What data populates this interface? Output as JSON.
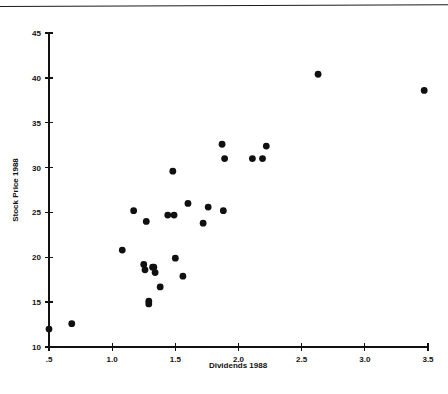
{
  "figure": {
    "background_color": "#ffffff",
    "ink_color": "#101010",
    "has_top_rule": true
  },
  "chart_data": {
    "type": "scatter",
    "title": "",
    "subtitle": "",
    "xlabel": "Dividends 1988",
    "ylabel": "Stock Price 1988",
    "xlim": [
      0.5,
      3.5
    ],
    "ylim": [
      10,
      45
    ],
    "xticks": [
      0.5,
      1.0,
      1.5,
      2.0,
      2.5,
      3.0,
      3.5
    ],
    "xtick_labels": [
      ".5",
      "1.0",
      "1.5",
      "2.0",
      "2.5",
      "3.0",
      "3.5"
    ],
    "yticks": [
      10,
      15,
      20,
      25,
      30,
      35,
      40,
      45
    ],
    "ytick_labels": [
      "10",
      "15",
      "20",
      "25",
      "30",
      "35",
      "40",
      "45"
    ],
    "grid": false,
    "legend": null,
    "legend_position": "none",
    "marker": "filled-circle",
    "marker_color": "#101010",
    "marker_size_px": 3.4,
    "series": [
      {
        "name": "stocks",
        "points": [
          [
            0.5,
            12.0
          ],
          [
            0.68,
            12.6
          ],
          [
            1.08,
            20.8
          ],
          [
            1.17,
            25.2
          ],
          [
            1.25,
            19.2
          ],
          [
            1.26,
            18.6
          ],
          [
            1.27,
            24.0
          ],
          [
            1.29,
            14.8
          ],
          [
            1.29,
            15.1
          ],
          [
            1.32,
            18.9
          ],
          [
            1.33,
            18.9
          ],
          [
            1.34,
            18.3
          ],
          [
            1.38,
            16.7
          ],
          [
            1.44,
            24.7
          ],
          [
            1.48,
            29.6
          ],
          [
            1.49,
            24.7
          ],
          [
            1.5,
            19.9
          ],
          [
            1.56,
            17.9
          ],
          [
            1.6,
            26.0
          ],
          [
            1.72,
            23.8
          ],
          [
            1.76,
            25.6
          ],
          [
            1.87,
            32.6
          ],
          [
            1.88,
            25.2
          ],
          [
            1.89,
            31.0
          ],
          [
            2.11,
            31.0
          ],
          [
            2.19,
            31.0
          ],
          [
            2.22,
            32.4
          ],
          [
            2.63,
            40.4
          ],
          [
            3.47,
            38.6
          ]
        ]
      }
    ]
  }
}
